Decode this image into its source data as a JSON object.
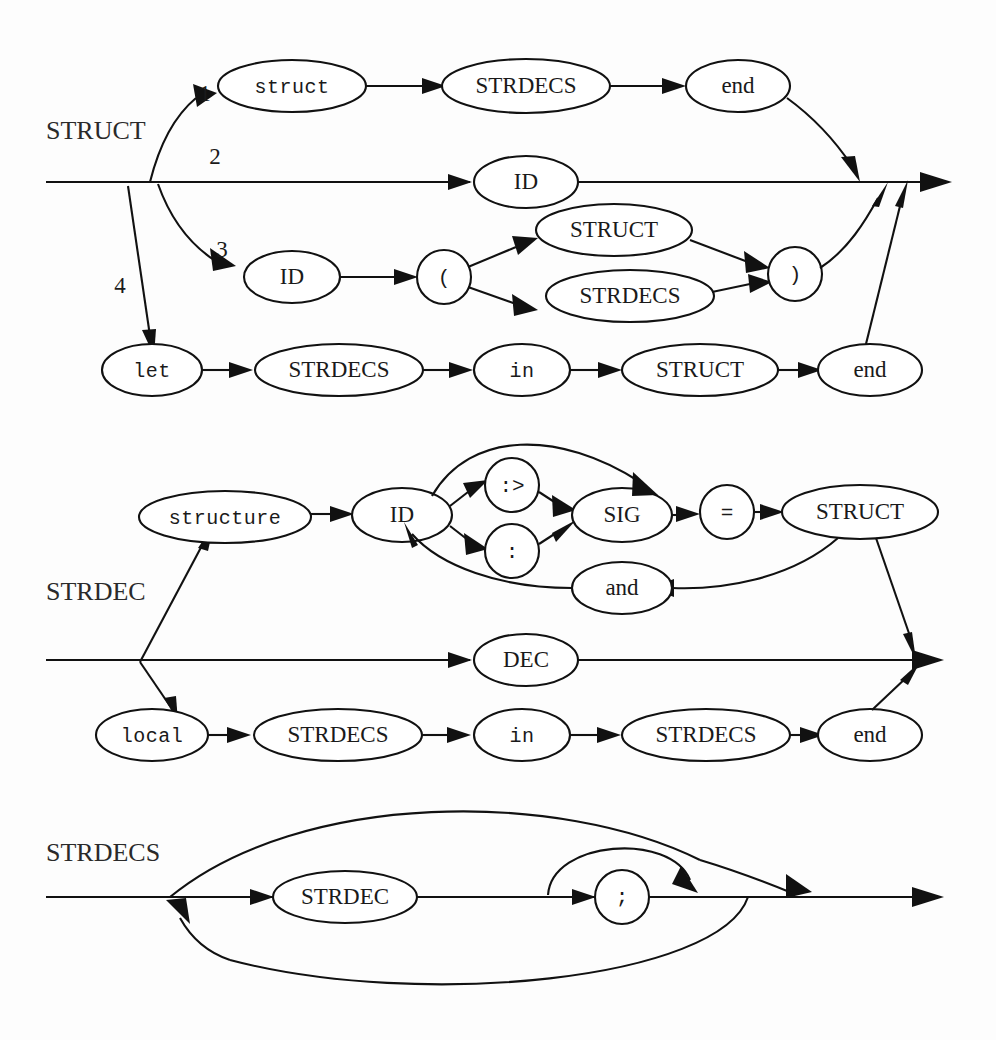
{
  "page": {
    "kind": "syntax-railroad-diagrams",
    "width": 996,
    "height": 1040,
    "background_color": "#fdfdfd",
    "ink_color": "#111111"
  },
  "diagrams": [
    {
      "id": "struct",
      "rule_name": "STRUCT",
      "branch_numbers": [
        "1",
        "2",
        "3",
        "4"
      ],
      "nodes": {
        "struct_kw": "struct",
        "strdecs_1": "STRDECS",
        "end_1": "end",
        "id_2": "ID",
        "id_3": "ID",
        "lparen": "(",
        "struct_nt": "STRUCT",
        "strdecs_3": "STRDECS",
        "rparen": ")",
        "let_kw": "let",
        "strdecs_4": "STRDECS",
        "in_kw": "in",
        "struct_4": "STRUCT",
        "end_4": "end"
      }
    },
    {
      "id": "strdec",
      "rule_name": "STRDEC",
      "branch_numbers": [],
      "nodes": {
        "structure_kw": "structure",
        "id": "ID",
        "opaque": ":>",
        "transparent": ":",
        "sig": "SIG",
        "equals": "=",
        "struct_nt": "STRUCT",
        "and_kw": "and",
        "dec": "DEC",
        "local_kw": "local",
        "strdecs_1": "STRDECS",
        "in_kw": "in",
        "strdecs_2": "STRDECS",
        "end_kw": "end"
      }
    },
    {
      "id": "strdecs",
      "rule_name": "STRDECS",
      "branch_numbers": [],
      "nodes": {
        "strdec": "STRDEC",
        "semicolon": ";"
      }
    }
  ]
}
